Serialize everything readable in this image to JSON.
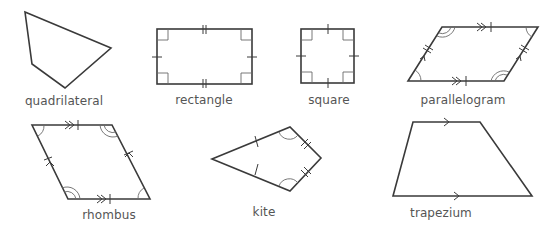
{
  "stroke_color": "#3a3a3a",
  "label_color": "#555555",
  "shapes": [
    {
      "name": "quadrilateral",
      "label": "quadrilateral",
      "properties": "no equal sides or parallel sides marked"
    },
    {
      "name": "rectangle",
      "label": "rectangle",
      "properties": "four right angles; opposite sides equal"
    },
    {
      "name": "square",
      "label": "square",
      "properties": "four right angles; all sides equal"
    },
    {
      "name": "parallelogram",
      "label": "parallelogram",
      "properties": "opposite sides parallel and equal; opposite angles equal"
    },
    {
      "name": "rhombus",
      "label": "rhombus",
      "properties": "all sides equal; opposite sides parallel; opposite angles equal"
    },
    {
      "name": "kite",
      "label": "kite",
      "properties": "two pairs of adjacent equal sides; one pair of equal angles"
    },
    {
      "name": "trapezium",
      "label": "trapezium",
      "properties": "one pair of parallel sides"
    }
  ]
}
